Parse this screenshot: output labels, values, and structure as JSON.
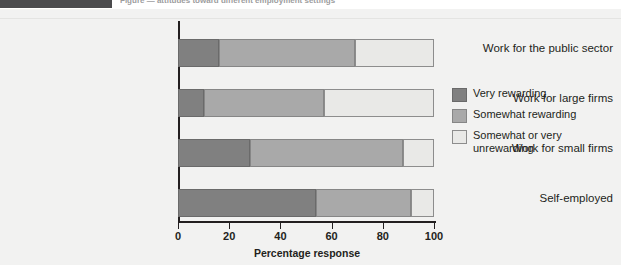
{
  "header": {
    "tab_label": "",
    "caption": "Figure — attitudes toward different employment settings"
  },
  "chart_data": {
    "type": "bar",
    "orientation": "horizontal",
    "stacked": true,
    "stack_mode": "percent",
    "title": "",
    "xlabel": "Percentage response",
    "ylabel": "",
    "xlim": [
      0,
      100
    ],
    "xticks": [
      0,
      20,
      40,
      60,
      80,
      100
    ],
    "xtick_labels": [
      "0",
      "20",
      "40",
      "60",
      "80",
      "100"
    ],
    "grid": false,
    "legend_position": "right",
    "categories": [
      "Work for the public sector",
      "Work for large firms",
      "Work for small firms",
      "Self-employed"
    ],
    "series": [
      {
        "name": "Very rewarding",
        "color": "#808080",
        "values": [
          16,
          10,
          28,
          54
        ]
      },
      {
        "name": "Somewhat rewarding",
        "color": "#a9a9a9",
        "values": [
          53,
          47,
          60,
          37
        ]
      },
      {
        "name": "Somewhat or very unrewarding",
        "color": "#e9e9e7",
        "values": [
          31,
          43,
          12,
          9
        ]
      }
    ]
  }
}
